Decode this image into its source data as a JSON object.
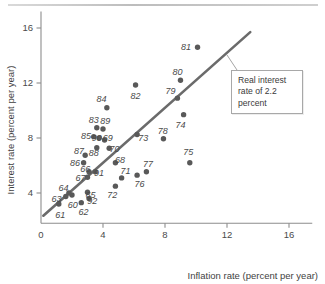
{
  "figure": {
    "name": "inflation-vs-interest-rate-scatter",
    "top_rule": true
  },
  "annotation": {
    "text": "Real interest rate of 2.2 percent",
    "line1": "Real interest",
    "line2": "rate of 2.2",
    "line3": "percent"
  },
  "chart_data": {
    "type": "scatter",
    "title": "",
    "xlabel": "Inflation rate (percent per year)",
    "ylabel": "Interest rate (percent per year)",
    "xlim": [
      0,
      17.5
    ],
    "ylim": [
      1.8,
      17.2
    ],
    "xticks": [
      0,
      4,
      8,
      12,
      16
    ],
    "yticks": [
      4,
      8,
      12,
      16
    ],
    "xticklabels": [
      "0",
      "4",
      "8",
      "12",
      "16"
    ],
    "yticklabels": [
      "4",
      "8",
      "12",
      "16"
    ],
    "grid": false,
    "legend": null,
    "trend_line": {
      "label": "Real interest rate of 2.2 percent",
      "intercept": 2.2,
      "slope": 1.0,
      "x_start": 0.15,
      "x_end": 13.5,
      "y_start": 2.35,
      "y_end": 15.7
    },
    "points": [
      {
        "label": "60",
        "x": 2.0,
        "y": 3.85,
        "lx": 2.05,
        "ly": 3.15
      },
      {
        "label": "61",
        "x": 1.15,
        "y": 3.2,
        "lx": 1.25,
        "ly": 2.45
      },
      {
        "label": "62",
        "x": 2.6,
        "y": 3.3,
        "lx": 2.75,
        "ly": 2.6
      },
      {
        "label": "63",
        "x": 1.6,
        "y": 3.75,
        "lx": 1.0,
        "ly": 3.6
      },
      {
        "label": "64",
        "x": 1.8,
        "y": 4.0,
        "lx": 1.45,
        "ly": 4.4
      },
      {
        "label": "65",
        "x": 3.0,
        "y": 4.05,
        "lx": 3.2,
        "ly": 3.85
      },
      {
        "label": "66",
        "x": 3.0,
        "y": 5.15,
        "lx": 2.85,
        "ly": 5.75
      },
      {
        "label": "67",
        "x": 3.1,
        "y": 5.55,
        "lx": 2.55,
        "ly": 5.1
      },
      {
        "label": "68",
        "x": 4.8,
        "y": 6.2,
        "lx": 5.1,
        "ly": 6.45
      },
      {
        "label": "69",
        "x": 4.1,
        "y": 7.85,
        "lx": 4.3,
        "ly": 8.0
      },
      {
        "label": "70",
        "x": 4.4,
        "y": 7.25,
        "lx": 4.75,
        "ly": 7.25
      },
      {
        "label": "71",
        "x": 5.2,
        "y": 5.1,
        "lx": 5.45,
        "ly": 5.6
      },
      {
        "label": "72",
        "x": 4.8,
        "y": 4.5,
        "lx": 4.6,
        "ly": 3.9
      },
      {
        "label": "73",
        "x": 6.2,
        "y": 8.25,
        "lx": 6.6,
        "ly": 8.05
      },
      {
        "label": "74",
        "x": 9.2,
        "y": 9.7,
        "lx": 9.0,
        "ly": 8.95
      },
      {
        "label": "75",
        "x": 9.6,
        "y": 6.2,
        "lx": 9.5,
        "ly": 7.0
      },
      {
        "label": "76",
        "x": 6.2,
        "y": 5.3,
        "lx": 6.35,
        "ly": 4.65
      },
      {
        "label": "77",
        "x": 6.8,
        "y": 5.55,
        "lx": 6.9,
        "ly": 6.1
      },
      {
        "label": "78",
        "x": 7.9,
        "y": 7.95,
        "lx": 7.85,
        "ly": 8.5
      },
      {
        "label": "79",
        "x": 8.8,
        "y": 10.9,
        "lx": 8.35,
        "ly": 11.4
      },
      {
        "label": "80",
        "x": 9.0,
        "y": 12.2,
        "lx": 8.8,
        "ly": 12.85
      },
      {
        "label": "81",
        "x": 10.1,
        "y": 14.6,
        "lx": 9.35,
        "ly": 14.6
      },
      {
        "label": "82",
        "x": 6.1,
        "y": 11.85,
        "lx": 6.1,
        "ly": 11.1
      },
      {
        "label": "83",
        "x": 3.6,
        "y": 8.75,
        "lx": 3.4,
        "ly": 9.3
      },
      {
        "label": "84",
        "x": 4.25,
        "y": 10.2,
        "lx": 3.9,
        "ly": 10.85
      },
      {
        "label": "85",
        "x": 3.4,
        "y": 8.1,
        "lx": 2.9,
        "ly": 8.15
      },
      {
        "label": "86",
        "x": 2.75,
        "y": 6.2,
        "lx": 2.2,
        "ly": 6.2
      },
      {
        "label": "87",
        "x": 2.85,
        "y": 6.75,
        "lx": 2.45,
        "ly": 7.05
      },
      {
        "label": "88",
        "x": 3.6,
        "y": 7.3,
        "lx": 3.4,
        "ly": 6.95
      },
      {
        "label": "89",
        "x": 4.0,
        "y": 8.65,
        "lx": 4.15,
        "ly": 9.25
      },
      {
        "label": "90",
        "x": 3.75,
        "y": 8.0,
        "lx": 3.6,
        "ly": 8.05
      },
      {
        "label": "91",
        "x": 3.5,
        "y": 5.55,
        "lx": 3.75,
        "ly": 5.45
      },
      {
        "label": "92",
        "x": 3.1,
        "y": 3.6,
        "lx": 3.3,
        "ly": 3.45
      }
    ]
  }
}
